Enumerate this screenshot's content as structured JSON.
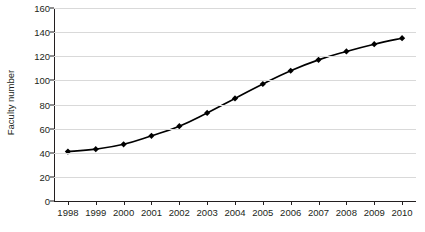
{
  "chart_data": {
    "type": "line",
    "title": "",
    "xlabel": "",
    "ylabel": "Faculty number",
    "categories": [
      "1998",
      "1999",
      "2000",
      "2001",
      "2002",
      "2003",
      "2004",
      "2005",
      "2006",
      "2007",
      "2008",
      "2009",
      "2010"
    ],
    "x": [
      1998,
      1999,
      2000,
      2001,
      2002,
      2003,
      2004,
      2005,
      2006,
      2007,
      2008,
      2009,
      2010
    ],
    "values": [
      41,
      43,
      47,
      54,
      62,
      73,
      85,
      97,
      108,
      117,
      124,
      130,
      135
    ],
    "series": [
      {
        "name": "Faculty number",
        "values": [
          41,
          43,
          47,
          54,
          62,
          73,
          85,
          97,
          108,
          117,
          124,
          130,
          135
        ],
        "marker": "diamond",
        "color": "#000000"
      }
    ],
    "ylim": [
      0,
      160
    ],
    "yticks": [
      0,
      20,
      40,
      60,
      80,
      100,
      120,
      140,
      160
    ],
    "ytick_labels": [
      "0",
      "20",
      "40",
      "60",
      "80",
      "100",
      "120",
      "140",
      "160"
    ],
    "grid": true,
    "grid_axis": "y",
    "grid_color": "#d9d9d9",
    "legend": false,
    "legend_position": "none",
    "axis_color": "#231f20",
    "background": "#ffffff"
  }
}
